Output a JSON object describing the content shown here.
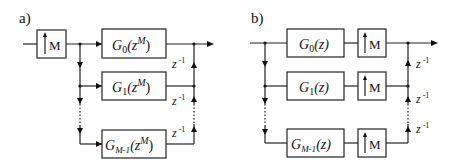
{
  "diagram_a": {
    "label": "a)",
    "upsampler": "M",
    "filters": [
      {
        "name": "G",
        "sub": "0",
        "arg": "(z",
        "sup": "M",
        "close": ")"
      },
      {
        "name": "G",
        "sub": "1",
        "arg": "(z",
        "sup": "M",
        "close": ")"
      },
      {
        "name": "G",
        "sub": "M-1",
        "arg": "(z",
        "sup": "M",
        "close": ")"
      }
    ],
    "delays": [
      {
        "base": "z",
        "exp": "-1"
      },
      {
        "base": "z",
        "exp": "-1"
      },
      {
        "base": "z",
        "exp": "-1"
      }
    ]
  },
  "diagram_b": {
    "label": "b)",
    "filters": [
      {
        "name": "G",
        "sub": "0",
        "arg": "(z)"
      },
      {
        "name": "G",
        "sub": "1",
        "arg": "(z)"
      },
      {
        "name": "G",
        "sub": "M-1",
        "arg": "(z)"
      }
    ],
    "upsamplers": [
      "M",
      "M",
      "M"
    ],
    "delays": [
      {
        "base": "z",
        "exp": "-1"
      },
      {
        "base": "z",
        "exp": "-1"
      },
      {
        "base": "z",
        "exp": "-1"
      }
    ]
  }
}
